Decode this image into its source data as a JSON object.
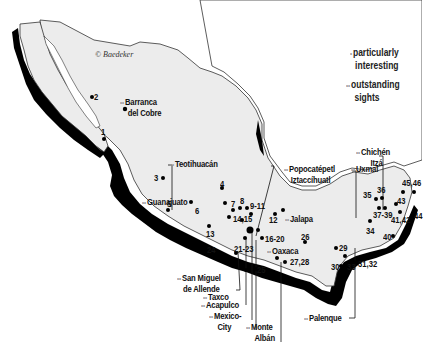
{
  "map": {
    "copyright": "© Baedeker",
    "colors": {
      "land": "#ececec",
      "coast_shadow": "#000000",
      "border": "#333333",
      "star": "#9a9a9a",
      "text": "#111111"
    },
    "legend": [
      {
        "symbol": "•",
        "label_line1": "particularly",
        "label_line2": "interesting"
      },
      {
        "symbol": "••",
        "label_line1": "outstanding",
        "label_line2": "sights"
      }
    ],
    "sights": [
      {
        "name": "Barranca del Cobre",
        "line1": "Barranca",
        "line2": "del Cobre",
        "stars": "••"
      },
      {
        "name": "Teotihuacán",
        "line1": "Teotihuacán",
        "stars": "••"
      },
      {
        "name": "Guanajuato",
        "line1": "Guanajuato",
        "stars": "••"
      },
      {
        "name": "Popocatépetl Iztaccíhuatl",
        "line1": "Popocatépetl",
        "line2": "Iztaccíhuatl",
        "stars": "••"
      },
      {
        "name": "Jalapa",
        "line1": "Jalapa",
        "stars": "••"
      },
      {
        "name": "Oaxaca",
        "line1": "Oaxaca",
        "stars": "••"
      },
      {
        "name": "Chichén Itzá",
        "line1": "Chichén",
        "line2": "Itzá",
        "stars": "••"
      },
      {
        "name": "Uxmal",
        "line1": "Uxmal",
        "stars": "••"
      },
      {
        "name": "San Miguel de Allende",
        "line1": "San Miguel",
        "line2": "de Allende",
        "stars": "••"
      },
      {
        "name": "Taxco",
        "line1": "Taxco",
        "stars": "••"
      },
      {
        "name": "Acapulco",
        "line1": "Acapulco",
        "stars": "••"
      },
      {
        "name": "Mexico City",
        "line1": "Mexico-",
        "line2": "City",
        "stars": "••"
      },
      {
        "name": "Monte Albán",
        "line1": "Monte",
        "line2": "Albán",
        "stars": "••"
      },
      {
        "name": "Palenque",
        "line1": "Palenque",
        "stars": "••"
      }
    ],
    "numbers": [
      "1",
      "2",
      "3",
      "4",
      "5",
      "6",
      "7",
      "8",
      "9-11",
      "12",
      "13",
      "14,15",
      "16-20",
      "21-23",
      "24",
      "25",
      "26",
      "27,28",
      "29",
      "30",
      "31,32",
      "33",
      "34",
      "35",
      "36",
      "37-39",
      "40",
      "41,42",
      "43",
      "44",
      "45,46"
    ]
  }
}
